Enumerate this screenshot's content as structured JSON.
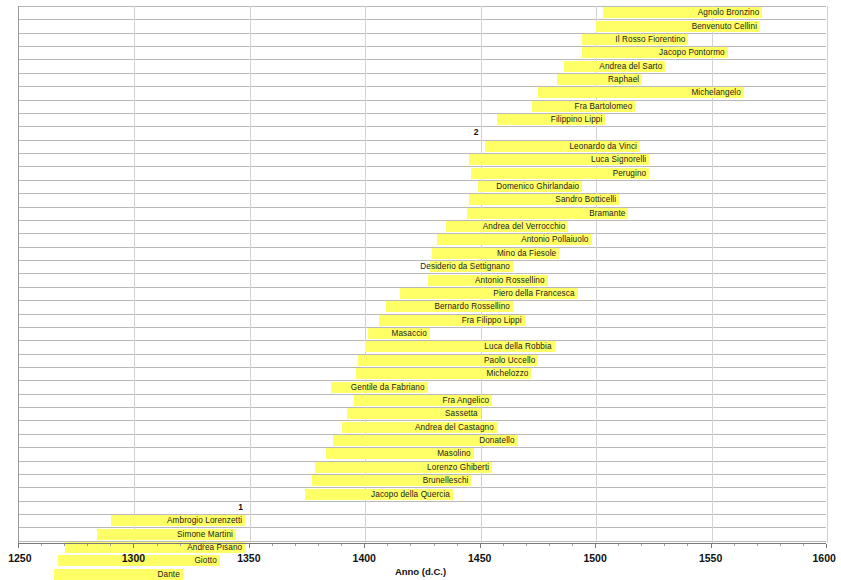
{
  "chart_data": {
    "type": "bar",
    "orientation": "horizontal",
    "subtype": "gantt-timeline",
    "title": "",
    "xlabel": "Anno (d.C.)",
    "ylabel": "",
    "xlim": [
      1250,
      1600
    ],
    "xticks": [
      1250,
      1300,
      1350,
      1400,
      1450,
      1500,
      1550,
      1600
    ],
    "xtick_labels": [
      "1250",
      "1300",
      "1350",
      "1400",
      "1450",
      "1500",
      "1550",
      "1600"
    ],
    "minor_tick_step": 10,
    "grid": true,
    "legend": "none",
    "bar_color": "#ffff66",
    "categories": [
      "Agnolo Bronzino",
      "Benvenuto Cellini",
      "Il Rosso Fiorentino",
      "Jacopo Pontormo",
      "Andrea del Sarto",
      "Raphael",
      "Michelangelo",
      "Fra Bartolomeo",
      "Filippino Lippi",
      "Leonardo da Vinci",
      "Luca Signorelli",
      "Perugino",
      "Domenico Ghirlandaio",
      "Sandro Botticelli",
      "Bramante",
      "Andrea del Verrocchio",
      "Antonio Pollaiuolo",
      "Mino da Fiesole",
      "Desiderio da Settignano",
      "Antonio Rossellino",
      "Piero della Francesca",
      "Bernardo Rossellino",
      "Fra Filippo Lippi",
      "Masaccio",
      "Luca della Robbia",
      "Paolo Uccello",
      "Michelozzo",
      "Gentile da Fabriano",
      "Fra Angelico",
      "Sassetta",
      "Andrea del Castagno",
      "Donatello",
      "Masolino",
      "Lorenzo Ghiberti",
      "Brunelleschi",
      "Jacopo della Quercia",
      "Ambrogio Lorenzetti",
      "Simone Martini",
      "Andrea Pisano",
      "Giotto",
      "Dante"
    ],
    "bars": [
      {
        "label": "Agnolo Bronzino",
        "start": 1503,
        "end": 1572,
        "row": 0
      },
      {
        "label": "Benvenuto Cellini",
        "start": 1500,
        "end": 1571,
        "row": 1
      },
      {
        "label": "Il Rosso Fiorentino",
        "start": 1494,
        "end": 1540,
        "row": 2
      },
      {
        "label": "Jacopo Pontormo",
        "start": 1494,
        "end": 1557,
        "row": 3
      },
      {
        "label": "Andrea del Sarto",
        "start": 1486,
        "end": 1530,
        "row": 4
      },
      {
        "label": "Raphael",
        "start": 1483,
        "end": 1520,
        "row": 5
      },
      {
        "label": "Michelangelo",
        "start": 1475,
        "end": 1564,
        "row": 6
      },
      {
        "label": "Fra Bartolomeo",
        "start": 1472,
        "end": 1517,
        "row": 7
      },
      {
        "label": "Filippino Lippi",
        "start": 1457,
        "end": 1504,
        "row": 8
      },
      {
        "label": "Leonardo da Vinci",
        "start": 1452,
        "end": 1519,
        "row": 10
      },
      {
        "label": "Luca Signorelli",
        "start": 1445,
        "end": 1523,
        "row": 11
      },
      {
        "label": "Perugino",
        "start": 1446,
        "end": 1523,
        "row": 12
      },
      {
        "label": "Domenico Ghirlandaio",
        "start": 1449,
        "end": 1494,
        "row": 13
      },
      {
        "label": "Sandro Botticelli",
        "start": 1445,
        "end": 1510,
        "row": 14
      },
      {
        "label": "Bramante",
        "start": 1444,
        "end": 1514,
        "row": 15
      },
      {
        "label": "Andrea del Verrocchio",
        "start": 1435,
        "end": 1488,
        "row": 16
      },
      {
        "label": "Antonio Pollaiuolo",
        "start": 1431,
        "end": 1498,
        "row": 17
      },
      {
        "label": "Mino da Fiesole",
        "start": 1429,
        "end": 1484,
        "row": 18
      },
      {
        "label": "Desiderio da Settignano",
        "start": 1428,
        "end": 1464,
        "row": 19
      },
      {
        "label": "Antonio Rossellino",
        "start": 1427,
        "end": 1479,
        "row": 20
      },
      {
        "label": "Piero della Francesca",
        "start": 1415,
        "end": 1492,
        "row": 21
      },
      {
        "label": "Bernardo Rossellino",
        "start": 1409,
        "end": 1464,
        "row": 22
      },
      {
        "label": "Fra Filippo Lippi",
        "start": 1406,
        "end": 1469,
        "row": 23
      },
      {
        "label": "Masaccio",
        "start": 1401,
        "end": 1428,
        "row": 24
      },
      {
        "label": "Luca della Robbia",
        "start": 1400,
        "end": 1482,
        "row": 25
      },
      {
        "label": "Paolo Uccello",
        "start": 1397,
        "end": 1475,
        "row": 26
      },
      {
        "label": "Michelozzo",
        "start": 1396,
        "end": 1472,
        "row": 27
      },
      {
        "label": "Gentile da Fabriano",
        "start": 1385,
        "end": 1427,
        "row": 28
      },
      {
        "label": "Fra Angelico",
        "start": 1395,
        "end": 1455,
        "row": 29
      },
      {
        "label": "Sassetta",
        "start": 1392,
        "end": 1450,
        "row": 30
      },
      {
        "label": "Andrea del Castagno",
        "start": 1390,
        "end": 1457,
        "row": 31
      },
      {
        "label": "Donatello",
        "start": 1386,
        "end": 1466,
        "row": 32
      },
      {
        "label": "Masolino",
        "start": 1383,
        "end": 1447,
        "row": 33
      },
      {
        "label": "Lorenzo Ghiberti",
        "start": 1378,
        "end": 1455,
        "row": 34
      },
      {
        "label": "Brunelleschi",
        "start": 1377,
        "end": 1446,
        "row": 35
      },
      {
        "label": "Jacopo della Quercia",
        "start": 1374,
        "end": 1438,
        "row": 36
      },
      {
        "label": "Ambrogio Lorenzetti",
        "start": 1290,
        "end": 1348,
        "row": 38
      },
      {
        "label": "Simone Martini",
        "start": 1284,
        "end": 1344,
        "row": 39
      },
      {
        "label": "Andrea Pisano",
        "start": 1270,
        "end": 1348,
        "row": 40
      },
      {
        "label": "Giotto",
        "start": 1267,
        "end": 1337,
        "row": 41
      },
      {
        "label": "Dante",
        "start": 1265,
        "end": 1321,
        "row": 42
      }
    ],
    "annotations": [
      {
        "text": "1",
        "year": 1348,
        "row": 37
      },
      {
        "text": "2",
        "year": 1450,
        "row": 9
      }
    ]
  }
}
